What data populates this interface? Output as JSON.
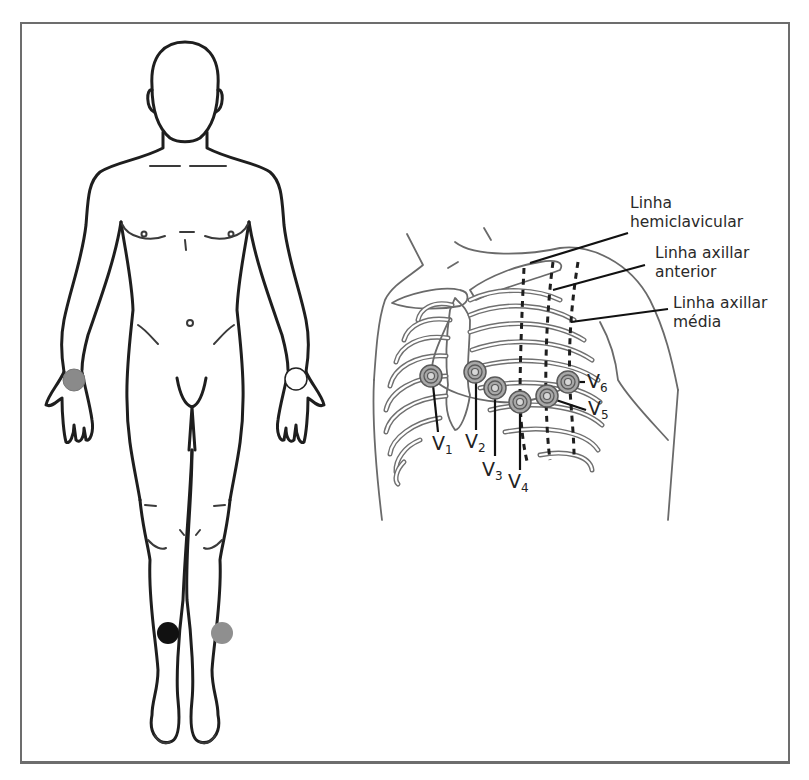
{
  "figure": {
    "title": "",
    "frame_color": "#6d6d6d"
  },
  "body_diagram": {
    "limb_electrodes": [
      {
        "id": "right-arm",
        "position": "right wrist (viewer left)",
        "color": "#8a8a8a",
        "cx": 74,
        "cy": 380,
        "r": 11
      },
      {
        "id": "left-arm",
        "position": "left wrist (viewer right)",
        "color": "#ffffff",
        "cx": 296,
        "cy": 379,
        "r": 11
      },
      {
        "id": "right-leg",
        "position": "right lower leg (viewer left)",
        "color": "#111111",
        "cx": 168,
        "cy": 633,
        "r": 11
      },
      {
        "id": "left-leg",
        "position": "left lower leg (viewer right)",
        "color": "#8f8f8f",
        "cx": 222,
        "cy": 633,
        "r": 11
      }
    ]
  },
  "chest_diagram": {
    "reference_lines": [
      {
        "label_line1": "Linha",
        "label_line2": "hemiclavicular"
      },
      {
        "label_line1": "Linha axillar",
        "label_line2": "anterior"
      },
      {
        "label_line1": "Linha axillar",
        "label_line2": "média"
      }
    ],
    "precordial_electrodes": [
      {
        "name": "V",
        "sub": "1",
        "cx": 431,
        "cy": 376
      },
      {
        "name": "V",
        "sub": "2",
        "cx": 475,
        "cy": 372
      },
      {
        "name": "V",
        "sub": "3",
        "cx": 495,
        "cy": 388
      },
      {
        "name": "V",
        "sub": "4",
        "cx": 520,
        "cy": 402
      },
      {
        "name": "V",
        "sub": "5",
        "cx": 547,
        "cy": 396
      },
      {
        "name": "V",
        "sub": "6",
        "cx": 568,
        "cy": 382
      }
    ],
    "electrode_colors": {
      "fill": "#a8a8a8",
      "ring": "#5a5a5a",
      "inner": "#d8d8d8"
    }
  }
}
